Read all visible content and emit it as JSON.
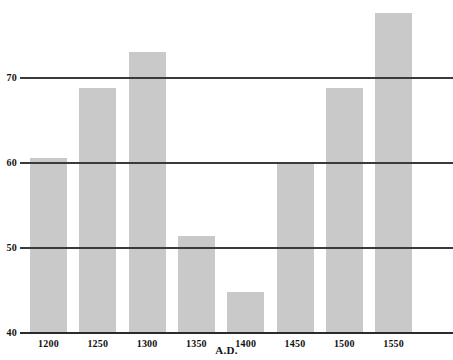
{
  "chart_data": {
    "type": "bar",
    "title": "",
    "subtitle": "",
    "xlabel": "A.D.",
    "ylabel": "",
    "categories": [
      "1200",
      "1250",
      "1300",
      "1350",
      "1400",
      "1450",
      "1500",
      "1550"
    ],
    "values": [
      60.6,
      68.8,
      73.1,
      51.4,
      44.8,
      60.1,
      68.8,
      77.6
    ],
    "series": [
      {
        "name": "",
        "values": [
          60.6,
          68.8,
          73.1,
          51.4,
          44.8,
          60.1,
          68.8,
          77.6
        ]
      }
    ],
    "ylim": [
      40,
      80
    ],
    "yticks": [
      40,
      50,
      60,
      70
    ],
    "ytick_labels": [
      "40",
      "50",
      "60",
      "70"
    ],
    "xtick_labels": [
      "1200",
      "1250",
      "1300",
      "1350",
      "1400",
      "1450",
      "1500",
      "1550"
    ],
    "grid": true,
    "grid_axis": "y",
    "legend": false,
    "legend_position": "none",
    "bar_color": "#c9c9c9",
    "gridline_color": "#3a3a3a",
    "axis_color": "#2b2b2b",
    "text_color": "#111111",
    "background_color": "#ffffff",
    "annotations": []
  },
  "axes": {
    "y": {
      "ticks": [
        {
          "label": "70",
          "value": 70
        },
        {
          "label": "60",
          "value": 60
        },
        {
          "label": "50",
          "value": 50
        },
        {
          "label": "40",
          "value": 40
        }
      ]
    },
    "x": {
      "title": "A.D.",
      "ticks": [
        {
          "label": "1200"
        },
        {
          "label": "1250"
        },
        {
          "label": "1300"
        },
        {
          "label": "1350"
        },
        {
          "label": "1400"
        },
        {
          "label": "1450"
        },
        {
          "label": "1500"
        },
        {
          "label": "1550"
        }
      ]
    }
  }
}
